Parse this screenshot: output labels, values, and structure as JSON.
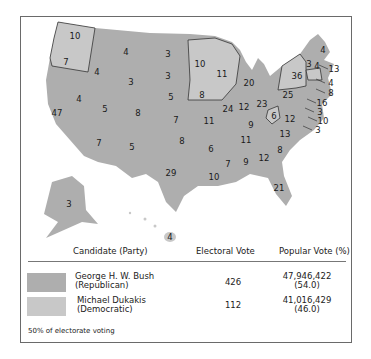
{
  "colors": {
    "republican": "#aeaeae",
    "democratic": "#c8c8c8",
    "border": "#222222"
  },
  "map_labels": [
    {
      "state": "WA",
      "ev": "10",
      "x": 75,
      "y": 36,
      "party": "D"
    },
    {
      "state": "OR",
      "ev": "7",
      "x": 66,
      "y": 62,
      "party": "D"
    },
    {
      "state": "CA",
      "ev": "47",
      "x": 57,
      "y": 113,
      "party": "R"
    },
    {
      "state": "ID",
      "ev": "4",
      "x": 97,
      "y": 72,
      "party": "R"
    },
    {
      "state": "NV",
      "ev": "4",
      "x": 79,
      "y": 99,
      "party": "R"
    },
    {
      "state": "MT",
      "ev": "4",
      "x": 126,
      "y": 52,
      "party": "R"
    },
    {
      "state": "WY",
      "ev": "3",
      "x": 131,
      "y": 82,
      "party": "R"
    },
    {
      "state": "UT",
      "ev": "5",
      "x": 105,
      "y": 109,
      "party": "R"
    },
    {
      "state": "CO",
      "ev": "8",
      "x": 138,
      "y": 113,
      "party": "R"
    },
    {
      "state": "AZ",
      "ev": "7",
      "x": 99,
      "y": 143,
      "party": "R"
    },
    {
      "state": "NM",
      "ev": "5",
      "x": 132,
      "y": 147,
      "party": "R"
    },
    {
      "state": "ND",
      "ev": "3",
      "x": 168,
      "y": 54,
      "party": "R"
    },
    {
      "state": "SD",
      "ev": "3",
      "x": 168,
      "y": 76,
      "party": "R"
    },
    {
      "state": "NE",
      "ev": "5",
      "x": 171,
      "y": 97,
      "party": "R"
    },
    {
      "state": "KS",
      "ev": "7",
      "x": 176,
      "y": 120,
      "party": "R"
    },
    {
      "state": "OK",
      "ev": "8",
      "x": 182,
      "y": 141,
      "party": "R"
    },
    {
      "state": "TX",
      "ev": "29",
      "x": 171,
      "y": 173,
      "party": "R"
    },
    {
      "state": "MN",
      "ev": "10",
      "x": 200,
      "y": 64,
      "party": "D"
    },
    {
      "state": "IA",
      "ev": "8",
      "x": 202,
      "y": 95,
      "party": "D"
    },
    {
      "state": "MO",
      "ev": "11",
      "x": 209,
      "y": 121,
      "party": "R"
    },
    {
      "state": "AR",
      "ev": "6",
      "x": 211,
      "y": 149,
      "party": "R"
    },
    {
      "state": "LA",
      "ev": "10",
      "x": 214,
      "y": 177,
      "party": "R"
    },
    {
      "state": "WI",
      "ev": "11",
      "x": 222,
      "y": 74,
      "party": "D"
    },
    {
      "state": "IL",
      "ev": "24",
      "x": 228,
      "y": 109,
      "party": "R"
    },
    {
      "state": "MI",
      "ev": "20",
      "x": 249,
      "y": 83,
      "party": "R"
    },
    {
      "state": "IN",
      "ev": "12",
      "x": 244,
      "y": 107,
      "party": "R"
    },
    {
      "state": "OH",
      "ev": "23",
      "x": 262,
      "y": 104,
      "party": "R"
    },
    {
      "state": "KY",
      "ev": "9",
      "x": 251,
      "y": 125,
      "party": "R"
    },
    {
      "state": "TN",
      "ev": "11",
      "x": 246,
      "y": 140,
      "party": "R"
    },
    {
      "state": "MS",
      "ev": "7",
      "x": 228,
      "y": 164,
      "party": "R"
    },
    {
      "state": "AL",
      "ev": "9",
      "x": 246,
      "y": 162,
      "party": "R"
    },
    {
      "state": "GA",
      "ev": "12",
      "x": 264,
      "y": 158,
      "party": "R"
    },
    {
      "state": "FL",
      "ev": "21",
      "x": 279,
      "y": 188,
      "party": "R"
    },
    {
      "state": "SC",
      "ev": "8",
      "x": 280,
      "y": 150,
      "party": "R"
    },
    {
      "state": "NC",
      "ev": "13",
      "x": 285,
      "y": 134,
      "party": "R"
    },
    {
      "state": "VA",
      "ev": "12",
      "x": 290,
      "y": 119,
      "party": "R"
    },
    {
      "state": "WV",
      "ev": "6",
      "x": 274,
      "y": 116,
      "party": "D"
    },
    {
      "state": "PA",
      "ev": "25",
      "x": 288,
      "y": 95,
      "party": "R"
    },
    {
      "state": "NY",
      "ev": "36",
      "x": 297,
      "y": 76,
      "party": "D"
    },
    {
      "state": "VT",
      "ev": "3",
      "x": 309,
      "y": 64,
      "party": "R"
    },
    {
      "state": "NH",
      "ev": "4",
      "x": 317,
      "y": 66,
      "party": "R"
    },
    {
      "state": "ME",
      "ev": "4",
      "x": 323,
      "y": 50,
      "party": "R"
    },
    {
      "state": "AK",
      "ev": "3",
      "x": 69,
      "y": 204,
      "party": "R"
    },
    {
      "state": "HI",
      "ev": "4",
      "x": 170,
      "y": 237,
      "party": "D"
    }
  ],
  "callouts": [
    {
      "state": "MA",
      "ev": "13",
      "x": 331,
      "y": 69
    },
    {
      "state": "RI",
      "ev": "4",
      "x": 328,
      "y": 83
    },
    {
      "state": "CT",
      "ev": "8",
      "x": 328,
      "y": 93
    },
    {
      "state": "NJ",
      "ev": "16",
      "x": 319,
      "y": 103
    },
    {
      "state": "DE",
      "ev": "3",
      "x": 317,
      "y": 112
    },
    {
      "state": "MD",
      "ev": "10",
      "x": 320,
      "y": 121
    },
    {
      "state": "DC",
      "ev": "3",
      "x": 315,
      "y": 130
    }
  ],
  "legend": {
    "headers": {
      "candidate": "Candidate (Party)",
      "electoral": "Electoral Vote",
      "popular": "Popular Vote (%)"
    },
    "rows": [
      {
        "name": "George H. W. Bush",
        "party": "(Republican)",
        "electoral": "426",
        "popular": "47,946,422",
        "percent": "(54.0)"
      },
      {
        "name": "Michael Dukakis",
        "party": "(Democratic)",
        "electoral": "112",
        "popular": "41,016,429",
        "percent": "(46.0)"
      }
    ],
    "footnote": "50% of electorate voting"
  }
}
